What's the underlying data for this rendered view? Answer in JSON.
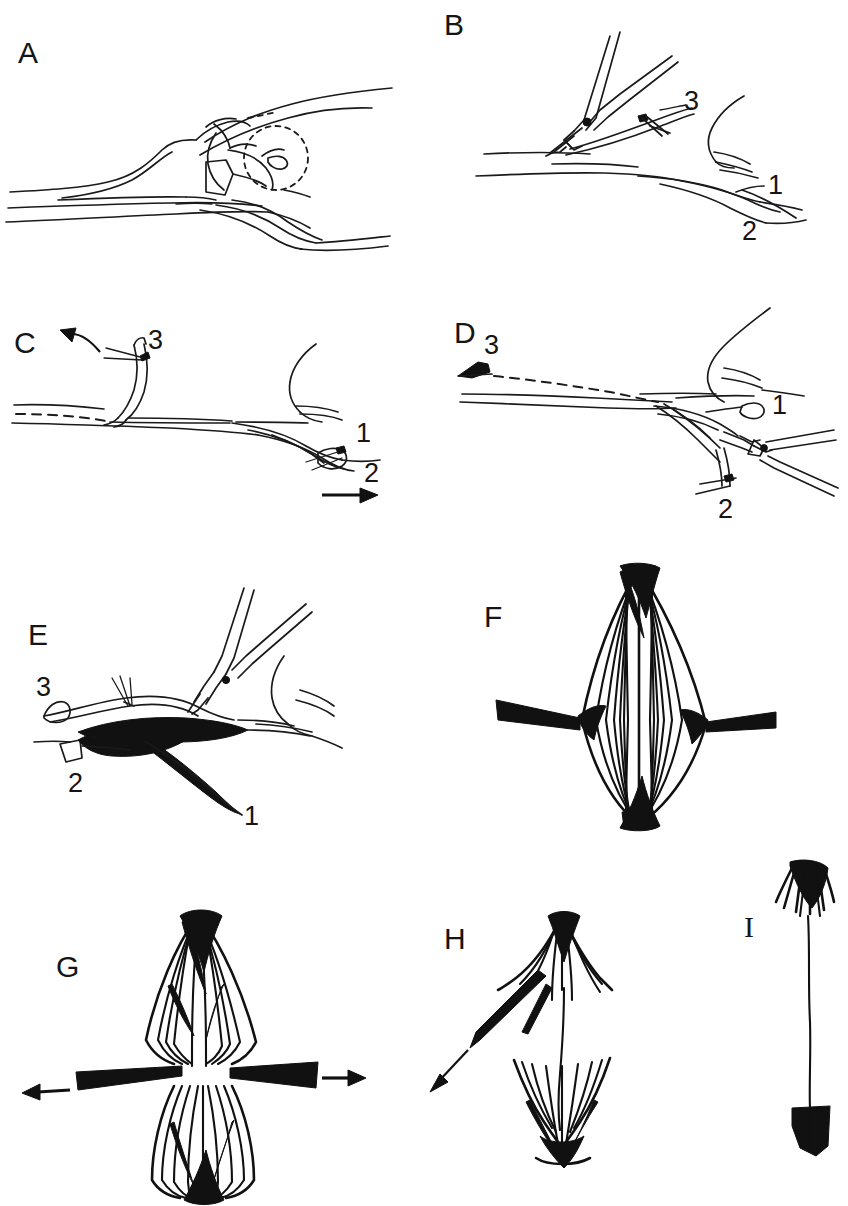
{
  "figure": {
    "background_color": "#ffffff",
    "ink_color": "#1a1a1a",
    "width": 848,
    "height": 1206
  },
  "panels": [
    {
      "id": "A",
      "letter": "A",
      "letter_x": 18,
      "letter_y": 38,
      "caption": "Anatomical overview with dashed circle marking region of interest",
      "labels": [],
      "has_dashed_circle": true,
      "has_instrument": false,
      "arrows": []
    },
    {
      "id": "B",
      "letter": "B",
      "letter_x": 444,
      "letter_y": 10,
      "caption": "Forceps grasping structure, three numbered branches",
      "labels": [
        {
          "text": "3",
          "x": 684,
          "y": 88
        },
        {
          "text": "1",
          "x": 768,
          "y": 172
        },
        {
          "text": "2",
          "x": 742,
          "y": 218
        }
      ],
      "has_dashed_circle": false,
      "has_instrument": true,
      "arrows": []
    },
    {
      "id": "C",
      "letter": "C",
      "letter_x": 14,
      "letter_y": 328,
      "caption": "Branch 3 reflected upward, branch 2 pulled to the right",
      "labels": [
        {
          "text": "3",
          "x": 148,
          "y": 327
        },
        {
          "text": "1",
          "x": 356,
          "y": 420
        },
        {
          "text": "2",
          "x": 364,
          "y": 460
        }
      ],
      "has_dashed_circle": false,
      "has_instrument": false,
      "arrows": [
        {
          "kind": "curved",
          "direction": "up-left",
          "x": 70,
          "y": 330
        },
        {
          "kind": "straight",
          "direction": "right",
          "x": 322,
          "y": 503
        }
      ]
    },
    {
      "id": "D",
      "letter": "D",
      "letter_x": 454,
      "letter_y": 318,
      "caption": "Forceps at lower right, divided stump 3 shown at left",
      "labels": [
        {
          "text": "3",
          "x": 484,
          "y": 332
        },
        {
          "text": "1",
          "x": 772,
          "y": 392
        },
        {
          "text": "2",
          "x": 718,
          "y": 496
        }
      ],
      "has_dashed_circle": false,
      "has_instrument": true,
      "arrows": []
    },
    {
      "id": "E",
      "letter": "E",
      "letter_x": 28,
      "letter_y": 620,
      "caption": "Completed transfer, dark graft sutured in place",
      "labels": [
        {
          "text": "3",
          "x": 36,
          "y": 674
        },
        {
          "text": "2",
          "x": 68,
          "y": 770
        },
        {
          "text": "1",
          "x": 244,
          "y": 803
        }
      ],
      "has_dashed_circle": false,
      "has_instrument": true,
      "arrows": []
    },
    {
      "id": "F",
      "letter": "F",
      "letter_x": 484,
      "letter_y": 602,
      "caption": "Fusiform muscle with intact fibre bundles and two tendons",
      "labels": [],
      "has_dashed_circle": false,
      "has_instrument": false,
      "arrows": []
    },
    {
      "id": "G",
      "letter": "G",
      "letter_x": 56,
      "letter_y": 952,
      "caption": "Muscle split longitudinally, tendons retracted in opposite directions",
      "labels": [],
      "has_dashed_circle": false,
      "has_instrument": false,
      "arrows": [
        {
          "kind": "straight",
          "direction": "left",
          "x": 20,
          "y": 1093
        },
        {
          "kind": "straight",
          "direction": "right",
          "x": 340,
          "y": 1082
        }
      ]
    },
    {
      "id": "H",
      "letter": "H",
      "letter_x": 444,
      "letter_y": 924,
      "caption": "Halves separated, one tendon drawn away",
      "labels": [],
      "has_dashed_circle": false,
      "has_instrument": false,
      "arrows": [
        {
          "kind": "straight-thin",
          "direction": "down-left",
          "x": 418,
          "y": 1077
        }
      ]
    },
    {
      "id": "I",
      "letter": "I",
      "letter_x": 744,
      "letter_y": 918,
      "caption": "Final elongated strip with tufted ends",
      "labels": [],
      "has_dashed_circle": false,
      "has_instrument": false,
      "arrows": []
    }
  ]
}
